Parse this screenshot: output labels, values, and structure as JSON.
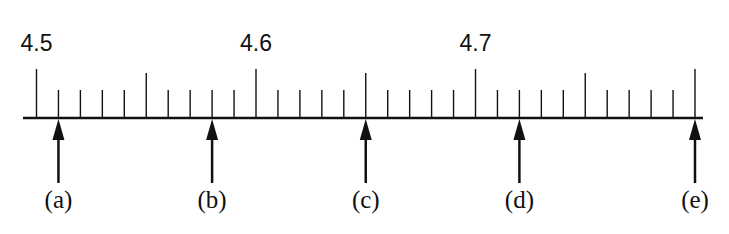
{
  "diagram": {
    "type": "number-line",
    "axis": {
      "start": 4.5,
      "end": 4.8,
      "minor_step": 0.01,
      "medium_step": 0.05,
      "major_step": 0.1
    },
    "major_labels": [
      {
        "value": 4.5,
        "text": "4.5"
      },
      {
        "value": 4.6,
        "text": "4.6"
      },
      {
        "value": 4.7,
        "text": "4.7"
      }
    ],
    "points": [
      {
        "label": "(a)",
        "value": 4.51
      },
      {
        "label": "(b)",
        "value": 4.58
      },
      {
        "label": "(c)",
        "value": 4.65
      },
      {
        "label": "(d)",
        "value": 4.72
      },
      {
        "label": "(e)",
        "value": 4.8
      }
    ],
    "colors": {
      "ink": "#111111",
      "background": "#ffffff"
    }
  }
}
